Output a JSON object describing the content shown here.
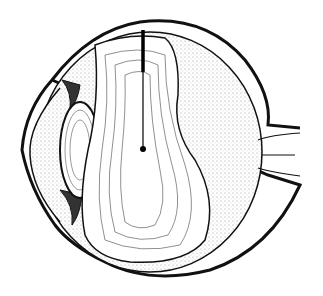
{
  "figure": {
    "colors": {
      "stroke": "#111111",
      "background": "#ffffff",
      "stipple": "#cfcfcf"
    },
    "labels": []
  }
}
